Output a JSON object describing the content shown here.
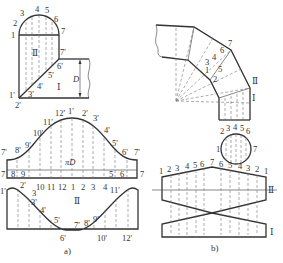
{
  "figure_a": {
    "caption": "a)",
    "top_view": {
      "semicircle_labels": [
        "1",
        "2",
        "3",
        "4",
        "5",
        "6",
        "7"
      ],
      "prime_labels": [
        "1'",
        "2'",
        "3'",
        "4'",
        "5'",
        "6'",
        "7'"
      ],
      "part_labels": {
        "upper": "Ⅱ",
        "lower": "Ⅰ"
      },
      "dimension": "D"
    },
    "pattern_I": {
      "curve_labels": [
        "7'",
        "8'",
        "9'",
        "10'",
        "11'",
        "12'",
        "1'",
        "2'",
        "3'",
        "4'",
        "5'",
        "6'",
        "7'"
      ],
      "center_text": "πD",
      "base_labels_left": [
        "7",
        "8",
        "9"
      ],
      "base_labels_right": [
        "5",
        "6",
        "7"
      ]
    },
    "pattern_II": {
      "top_labels": [
        "1'",
        "2'",
        "3",
        "10",
        "11",
        "12",
        "1",
        "2",
        "3",
        "4",
        "11'"
      ],
      "curve_labels": [
        "3'",
        "4'",
        "5'",
        "6'",
        "7'",
        "8'",
        "9'",
        "10'",
        "12'"
      ],
      "part_label": "Ⅱ"
    }
  },
  "figure_b": {
    "caption": "b)",
    "elbow_labels": [
      "1",
      "2",
      "3",
      "4",
      "5",
      "6",
      "7"
    ],
    "part_labels": {
      "upper": "Ⅱ",
      "lower": "Ⅰ"
    },
    "circle_labels": [
      "1",
      "2",
      "3",
      "4",
      "5",
      "6",
      "7"
    ],
    "pattern_top_labels": [
      "1",
      "2",
      "3",
      "4",
      "5",
      "6",
      "7",
      "6",
      "5",
      "4",
      "3",
      "2",
      "1"
    ],
    "pattern_part_labels": {
      "upper": "Ⅱ",
      "lower": "Ⅰ"
    }
  }
}
